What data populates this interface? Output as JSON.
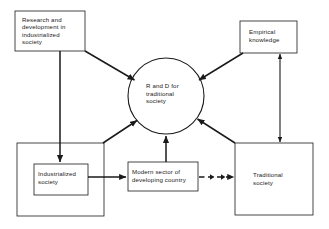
{
  "diagram": {
    "background_color": "#ffffff",
    "stroke_color": "#1a1a1a",
    "text_color": "#1a1a1a",
    "nodes": [
      {
        "id": "research-development",
        "shape": "rect",
        "label": "Research and\ndevelopment in\nindustrialized\nsociety",
        "x": 15,
        "y": 11,
        "w": 70,
        "h": 40
      },
      {
        "id": "empirical-knowledge",
        "shape": "rect",
        "label": "Empirical\nknowledge",
        "x": 240,
        "y": 21,
        "w": 57,
        "h": 32
      },
      {
        "id": "rd-traditional-society",
        "shape": "circle",
        "label": "R and D for\ntraditional\nsociety",
        "cx": 166,
        "cy": 96,
        "r": 38
      },
      {
        "id": "industrialized-outer",
        "shape": "rect",
        "label": "",
        "x": 17,
        "y": 143,
        "w": 87,
        "h": 73
      },
      {
        "id": "industrialized-society",
        "shape": "rect",
        "label": "Industrialized\nsociety",
        "x": 34,
        "y": 164,
        "w": 54,
        "h": 31
      },
      {
        "id": "modern-sector",
        "shape": "rect",
        "label": "Modern sector of\ndeveloping country",
        "x": 128,
        "y": 162,
        "w": 70,
        "h": 29
      },
      {
        "id": "traditional-society",
        "shape": "rect",
        "label": "Traditional\nsociety",
        "x": 235,
        "y": 143,
        "w": 78,
        "h": 72
      }
    ],
    "edges": [
      {
        "id": "rd-to-circle-diagonal",
        "from": "research-development",
        "to": "rd-traditional-society",
        "style": "solid",
        "arrow": "single"
      },
      {
        "id": "rd-to-industrialized",
        "from": "research-development",
        "to": "industrialized-society",
        "style": "solid",
        "arrow": "single"
      },
      {
        "id": "empirical-to-circle",
        "from": "empirical-knowledge",
        "to": "rd-traditional-society",
        "style": "solid",
        "arrow": "single"
      },
      {
        "id": "empirical-to-traditional",
        "from": "empirical-knowledge",
        "to": "traditional-society",
        "style": "solid",
        "arrow": "double"
      },
      {
        "id": "industrialized-outer-to-circle",
        "from": "industrialized-outer",
        "to": "rd-traditional-society",
        "style": "solid",
        "arrow": "single"
      },
      {
        "id": "modern-sector-to-circle",
        "from": "modern-sector",
        "to": "rd-traditional-society",
        "style": "solid",
        "arrow": "single"
      },
      {
        "id": "traditional-to-circle",
        "from": "traditional-society",
        "to": "rd-traditional-society",
        "style": "solid",
        "arrow": "single"
      },
      {
        "id": "industrialized-to-modern-sector",
        "from": "industrialized-society",
        "to": "modern-sector",
        "style": "solid",
        "arrow": "single"
      },
      {
        "id": "modern-sector-to-traditional",
        "from": "modern-sector",
        "to": "traditional-society",
        "style": "dashed",
        "arrow": "single"
      }
    ]
  }
}
